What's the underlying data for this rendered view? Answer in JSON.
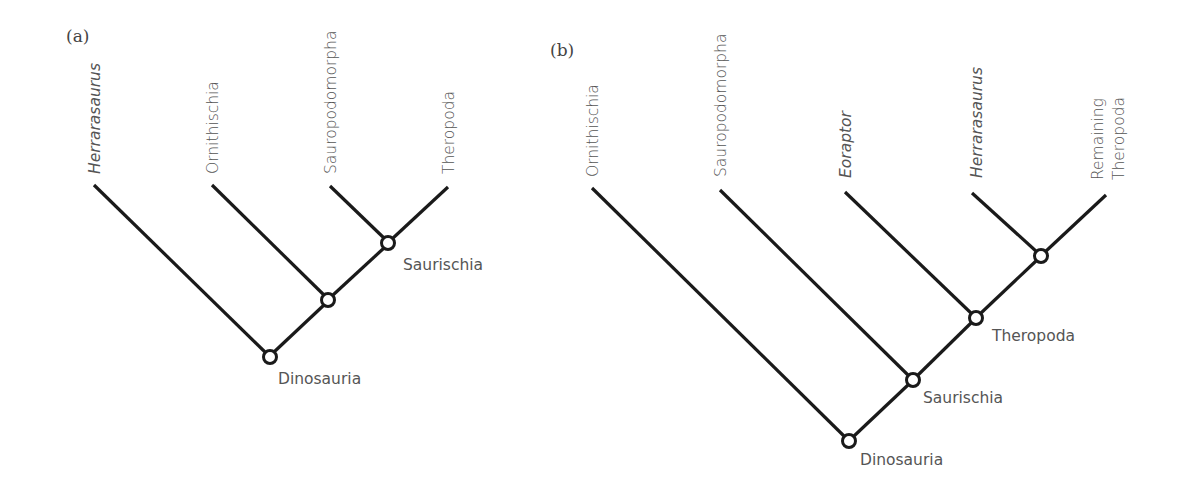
{
  "panels": [
    {
      "label": "(a)",
      "taxa": [
        {
          "name": "Herrarasaurus",
          "italic": true
        },
        {
          "name": "Ornithischia",
          "italic": false
        },
        {
          "name": "Sauropodomorpha",
          "italic": false
        },
        {
          "name": "Theropoda",
          "italic": false
        }
      ],
      "clades": [
        {
          "name": "Saurischia"
        },
        {
          "name": "Dinosauria"
        }
      ]
    },
    {
      "label": "(b)",
      "taxa": [
        {
          "name": "Ornithischia",
          "italic": false
        },
        {
          "name": "Sauropodomorpha",
          "italic": false
        },
        {
          "name": "Eoraptor",
          "italic": true
        },
        {
          "name": "Herrarasaurus",
          "italic": true
        },
        {
          "name": "Remaining",
          "italic": false,
          "line2": "Theropoda"
        }
      ],
      "clades": [
        {
          "name": "Theropoda"
        },
        {
          "name": "Saurischia"
        },
        {
          "name": "Dinosauria"
        }
      ]
    }
  ],
  "colors": {
    "line": "#1a1a1a",
    "text": "#555555",
    "background": "#ffffff"
  }
}
